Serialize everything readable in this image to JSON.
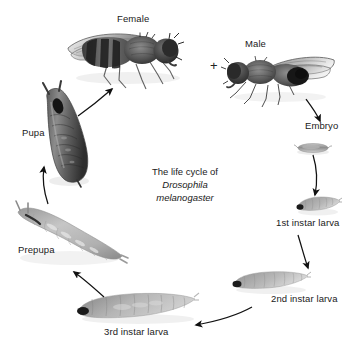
{
  "figure": {
    "background_color": "#ffffff",
    "caption_line1": "The life cycle of",
    "caption_genus": "Drosophila",
    "caption_species": "melanogaster",
    "mating_symbol": "+"
  },
  "stages": [
    {
      "id": "female",
      "label": "Female",
      "icon": "fruit-fly-female-photo",
      "label_x": 117,
      "label_y": 17
    },
    {
      "id": "male",
      "label": "Male",
      "icon": "fruit-fly-male-photo",
      "label_x": 245,
      "label_y": 42
    },
    {
      "id": "embryo",
      "label": "Embryo",
      "icon": "embryo-egg-photo",
      "label_x": 305,
      "label_y": 124
    },
    {
      "id": "instar1",
      "label": "1st instar larva",
      "icon": "first-instar-larva-photo",
      "label_x": 276,
      "label_y": 221
    },
    {
      "id": "instar2",
      "label": "2nd instar larva",
      "icon": "second-instar-larva-photo",
      "label_x": 271,
      "label_y": 297
    },
    {
      "id": "instar3",
      "label": "3rd instar larva",
      "icon": "third-instar-larva-photo",
      "label_x": 104,
      "label_y": 330
    },
    {
      "id": "prepupa",
      "label": "Prepupa",
      "icon": "prepupa-photo",
      "label_x": 18,
      "label_y": 248
    },
    {
      "id": "pupa",
      "label": "Pupa",
      "icon": "pupa-photo",
      "label_x": 22,
      "label_y": 131
    }
  ],
  "transitions": [
    {
      "from": "pupa",
      "to": "female",
      "name": "pupa-to-female-arrow"
    },
    {
      "from": "male",
      "to": "embryo",
      "name": "male-to-embryo-arrow"
    },
    {
      "from": "embryo",
      "to": "instar1",
      "name": "embryo-to-first-instar-arrow"
    },
    {
      "from": "instar1",
      "to": "instar2",
      "name": "first-to-second-instar-arrow"
    },
    {
      "from": "instar2",
      "to": "instar3",
      "name": "second-to-third-instar-arrow"
    },
    {
      "from": "instar3",
      "to": "prepupa",
      "name": "third-instar-to-prepupa-arrow"
    },
    {
      "from": "prepupa",
      "to": "pupa",
      "name": "prepupa-to-pupa-arrow"
    }
  ]
}
